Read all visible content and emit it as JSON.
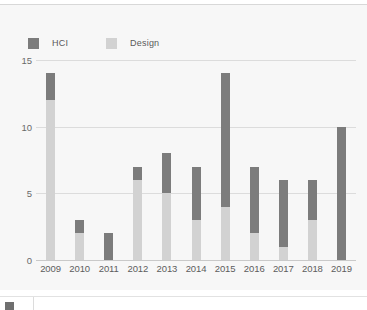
{
  "legend": {
    "items": [
      {
        "label": "HCI",
        "color": "#7c7c7c",
        "key": "hci"
      },
      {
        "label": "Design",
        "color": "#d2d2d2",
        "key": "design"
      }
    ]
  },
  "axes": {
    "y_ticks": [
      "15",
      "10",
      "5",
      "0"
    ],
    "x_ticks": [
      "2009",
      "2010",
      "2011",
      "2012",
      "2013",
      "2014",
      "2015",
      "2016",
      "2017",
      "2018",
      "2019"
    ]
  },
  "colors": {
    "hci": "#7c7c7c",
    "design": "#d2d2d2",
    "background": "#f7f7f7",
    "gridline": "#dcdcdc",
    "baseline": "#c9c9c9",
    "tick_text": "#5d5d5d"
  },
  "chart_data": {
    "type": "bar",
    "title": "",
    "subtitle": "",
    "xlabel": "",
    "ylabel": "",
    "stacked": true,
    "grid": true,
    "legend_position": "top-left",
    "ylim": [
      0,
      15
    ],
    "yticks": [
      0,
      5,
      10,
      15
    ],
    "categories": [
      "2009",
      "2010",
      "2011",
      "2012",
      "2013",
      "2014",
      "2015",
      "2016",
      "2017",
      "2018",
      "2019"
    ],
    "series": [
      {
        "name": "Design",
        "color": "#d2d2d2",
        "values": [
          12,
          2,
          0,
          6,
          5,
          3,
          4,
          2,
          1,
          3,
          0
        ]
      },
      {
        "name": "HCI",
        "color": "#7c7c7c",
        "values": [
          2,
          1,
          2,
          1,
          3,
          4,
          10,
          5,
          5,
          3,
          10
        ]
      }
    ],
    "totals": [
      14,
      3,
      2,
      7,
      8,
      7,
      14,
      7,
      6,
      6,
      10
    ]
  }
}
